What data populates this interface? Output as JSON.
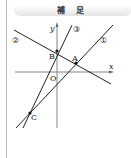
{
  "header": {
    "title": "補 足"
  },
  "diagram": {
    "axes": {
      "x_label": "x",
      "y_label": "y",
      "origin_label": "O"
    },
    "lines": [
      {
        "id": "line-1",
        "label": "①"
      },
      {
        "id": "line-2",
        "label": "②"
      },
      {
        "id": "line-3",
        "label": "③"
      }
    ],
    "points": [
      {
        "id": "A",
        "label": "A"
      },
      {
        "id": "B",
        "label": "B"
      },
      {
        "id": "C",
        "label": "C"
      }
    ]
  }
}
